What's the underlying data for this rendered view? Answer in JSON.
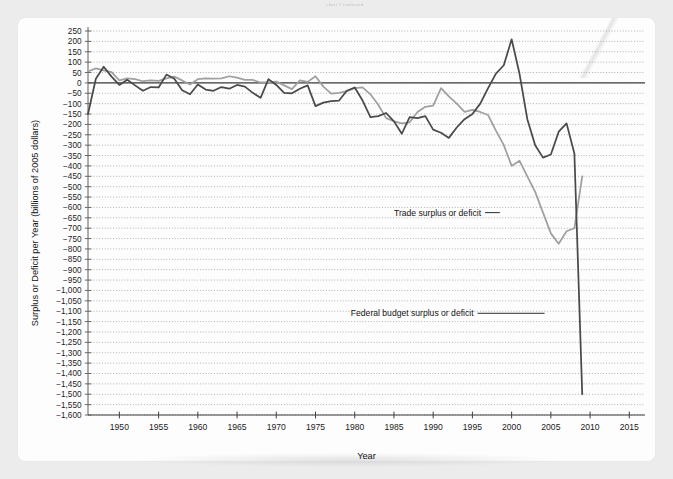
{
  "scan_artifact_text": "chart 7 continued",
  "chart_data": {
    "type": "line",
    "title": "",
    "xlabel": "Year",
    "ylabel": "Surplus or Deficit per Year (billions of 2005 dollars)",
    "xlim": [
      1946,
      2017
    ],
    "ylim": [
      -1600,
      250
    ],
    "ytick_step": 50,
    "yticks": [
      250,
      200,
      150,
      100,
      50,
      0,
      -50,
      -100,
      -150,
      -200,
      -250,
      -300,
      -350,
      -400,
      -450,
      -500,
      -550,
      -600,
      -650,
      -700,
      -750,
      -800,
      -850,
      -900,
      -950,
      -1000,
      -1050,
      -1100,
      -1150,
      -1200,
      -1250,
      -1300,
      -1350,
      -1400,
      -1450,
      -1500,
      -1550,
      -1600
    ],
    "ytick_labels": [
      "250",
      "200",
      "150",
      "100",
      "50",
      "0",
      "−50",
      "−100",
      "−150",
      "−200",
      "−250",
      "−300",
      "−350",
      "−400",
      "−450",
      "−500",
      "−550",
      "−600",
      "−650",
      "−700",
      "−750",
      "−800",
      "−850",
      "−900",
      "−950",
      "−1,000",
      "−1,050",
      "−1,100",
      "−1,150",
      "−1,200",
      "−1,250",
      "−1,300",
      "−1,350",
      "−1,400",
      "−1,450",
      "−1,500",
      "−1,550",
      "−1,600"
    ],
    "xticks": [
      1950,
      1955,
      1960,
      1965,
      1970,
      1975,
      1980,
      1985,
      1990,
      1995,
      2000,
      2005,
      2010,
      2015
    ],
    "xtick_labels": [
      "1950",
      "1955",
      "1960",
      "1965",
      "1970",
      "1975",
      "1980",
      "1985",
      "1990",
      "1995",
      "2000",
      "2005",
      "2010",
      "2015"
    ],
    "grid": "horizontal-dotted",
    "zero_line": true,
    "legend_position": "inline-annotation",
    "series": [
      {
        "name": "Trade surplus or deficit",
        "color": "#a0a0a0",
        "label_x": 1985.0,
        "label_y": -625,
        "leader_to_x": 1998.5,
        "leader_to_y": -625,
        "x": [
          1946,
          1947,
          1948,
          1949,
          1950,
          1951,
          1952,
          1953,
          1954,
          1955,
          1956,
          1957,
          1958,
          1959,
          1960,
          1961,
          1962,
          1963,
          1964,
          1965,
          1966,
          1967,
          1968,
          1969,
          1970,
          1971,
          1972,
          1973,
          1974,
          1975,
          1976,
          1977,
          1978,
          1979,
          1980,
          1981,
          1982,
          1983,
          1984,
          1985,
          1986,
          1987,
          1988,
          1989,
          1990,
          1991,
          1992,
          1993,
          1994,
          1995,
          1996,
          1997,
          1998,
          1999,
          2000,
          2001,
          2002,
          2003,
          2004,
          2005,
          2006,
          2007,
          2008,
          2009
        ],
        "values": [
          55,
          70,
          60,
          52,
          12,
          22,
          18,
          8,
          12,
          10,
          22,
          30,
          12,
          -8,
          18,
          22,
          20,
          22,
          32,
          25,
          15,
          14,
          2,
          2,
          6,
          -12,
          -30,
          12,
          5,
          32,
          -18,
          -52,
          -48,
          -40,
          -25,
          -22,
          -55,
          -105,
          -170,
          -185,
          -195,
          -190,
          -140,
          -115,
          -110,
          -25,
          -65,
          -100,
          -140,
          -130,
          -140,
          -155,
          -230,
          -300,
          -400,
          -375,
          -450,
          -525,
          -625,
          -725,
          -775,
          -715,
          -700,
          -450
        ]
      },
      {
        "name": "Federal budget surplus or deficit",
        "color": "#4a4a4a",
        "label_x": 1979.5,
        "label_y": -1110,
        "leader_to_x": 2004.2,
        "leader_to_y": -1110,
        "x": [
          1946,
          1947,
          1948,
          1949,
          1950,
          1951,
          1952,
          1953,
          1954,
          1955,
          1956,
          1957,
          1958,
          1959,
          1960,
          1961,
          1962,
          1963,
          1964,
          1965,
          1966,
          1967,
          1968,
          1969,
          1970,
          1971,
          1972,
          1973,
          1974,
          1975,
          1976,
          1977,
          1978,
          1979,
          1980,
          1981,
          1982,
          1983,
          1984,
          1985,
          1986,
          1987,
          1988,
          1989,
          1990,
          1991,
          1992,
          1993,
          1994,
          1995,
          1996,
          1997,
          1998,
          1999,
          2000,
          2001,
          2002,
          2003,
          2004,
          2005,
          2006,
          2007,
          2008,
          2009
        ],
        "values": [
          -150,
          20,
          78,
          30,
          -10,
          15,
          -12,
          -38,
          -20,
          -22,
          40,
          20,
          -35,
          -55,
          -8,
          -32,
          -38,
          -20,
          -28,
          -10,
          -18,
          -48,
          -72,
          18,
          -10,
          -48,
          -50,
          -28,
          -12,
          -112,
          -95,
          -88,
          -85,
          -38,
          -22,
          -85,
          -165,
          -160,
          -145,
          -185,
          -245,
          -165,
          -170,
          -160,
          -225,
          -240,
          -265,
          -215,
          -175,
          -150,
          -100,
          -25,
          45,
          85,
          210,
          45,
          -175,
          -300,
          -360,
          -345,
          -235,
          -195,
          -340,
          -1500
        ]
      }
    ]
  }
}
